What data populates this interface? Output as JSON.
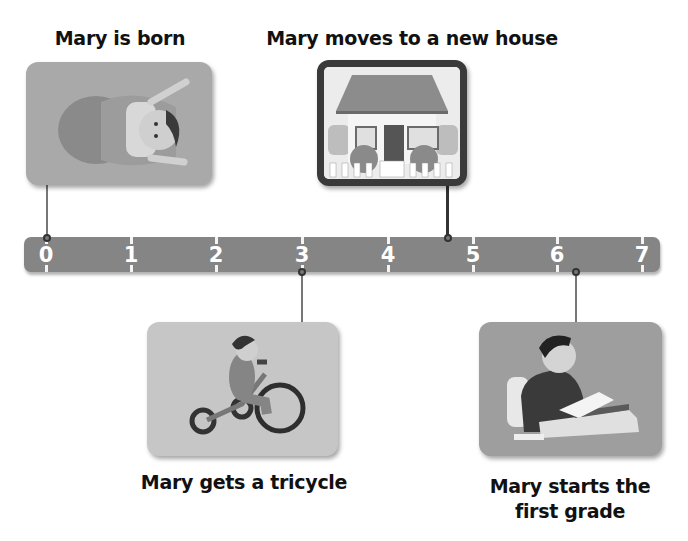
{
  "diagram": {
    "type": "timeline",
    "title": "",
    "axis": {
      "ticks": [
        "0",
        "1",
        "2",
        "3",
        "4",
        "5",
        "6",
        "7"
      ],
      "min": 0,
      "max": 7
    },
    "events": [
      {
        "id": "born",
        "label": "Mary is born",
        "position": 0,
        "side": "above",
        "image": "baby-in-blanket"
      },
      {
        "id": "house",
        "label": "Mary moves to a new house",
        "position": 4.75,
        "side": "above",
        "image": "house-with-fence"
      },
      {
        "id": "tricycle",
        "label": "Mary gets a tricycle",
        "position": 3,
        "side": "below",
        "image": "girl-on-tricycle"
      },
      {
        "id": "school",
        "label_line1": "Mary starts the",
        "label_line2": "first grade",
        "position": 6.25,
        "side": "below",
        "image": "girl-reading-at-desk"
      }
    ]
  },
  "colors": {
    "bar": "#858585",
    "card": "#a9a9a9",
    "frame": "#3a3a3a",
    "text": "#111111",
    "tick_label": "#ffffff"
  }
}
